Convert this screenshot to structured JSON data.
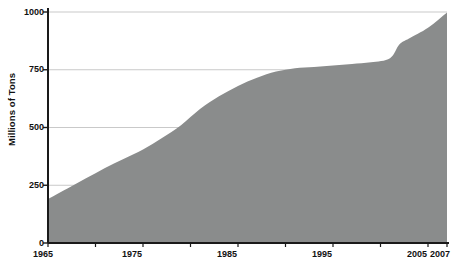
{
  "chart_data": {
    "type": "area",
    "title": "",
    "subtitle": "",
    "xlabel": "",
    "ylabel": "Millions of Tons",
    "xlim": [
      1965,
      2007
    ],
    "ylim": [
      0,
      1000
    ],
    "grid": true,
    "legend": null,
    "y_ticks": [
      0,
      250,
      500,
      750,
      1000
    ],
    "y_tick_labels": [
      "0",
      "250",
      "500",
      "750",
      "1000"
    ],
    "x_ticks": [
      1965,
      1975,
      1985,
      1995,
      2005,
      2007
    ],
    "x_tick_labels": [
      "1965",
      "1975",
      "1985",
      "1995",
      "2005",
      "2007"
    ],
    "x_minor_ticks": [
      1970,
      1980,
      1990,
      2000
    ],
    "series": [
      {
        "name": "Millions of Tons",
        "color": "#8a8c8c",
        "x": [
          1965,
          1967,
          1969,
          1971,
          1973,
          1975,
          1977,
          1979,
          1981,
          1983,
          1985,
          1987,
          1989,
          1991,
          1993,
          1995,
          1997,
          1999,
          2001,
          2002,
          2003,
          2005,
          2007
        ],
        "values": [
          190,
          235,
          280,
          325,
          365,
          405,
          455,
          510,
          580,
          635,
          680,
          715,
          742,
          757,
          762,
          768,
          775,
          782,
          800,
          860,
          885,
          932,
          998
        ]
      }
    ],
    "colors": {
      "area_fill": "#8a8c8c",
      "axis": "#1a1a1a",
      "grid": "#c9c9c9",
      "background": "#ffffff",
      "text": "#111111"
    }
  },
  "axis_labels": {
    "y_title": "Millions of Tons",
    "y": [
      "1000",
      "750",
      "500",
      "250",
      "0"
    ],
    "x": [
      "1965",
      "1975",
      "1985",
      "1995",
      "2005",
      "2007"
    ]
  }
}
